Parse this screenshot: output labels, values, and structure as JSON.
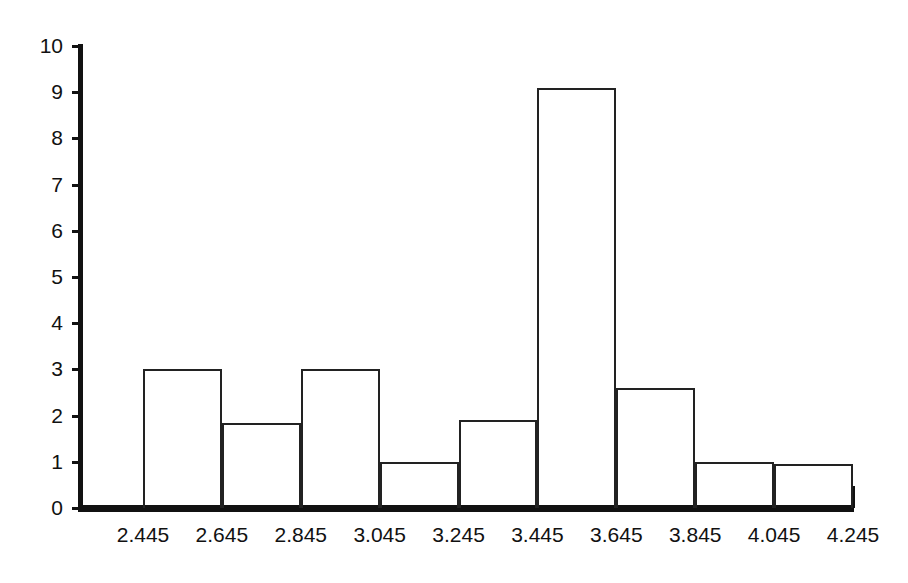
{
  "chart_data": {
    "type": "bar",
    "title": "",
    "subtitle": "",
    "xlabel": "",
    "ylabel": "",
    "grid": false,
    "legend": null,
    "style": "histogram-outline",
    "bin_edges": [
      2.445,
      2.645,
      2.845,
      3.045,
      3.245,
      3.445,
      3.645,
      3.845,
      4.045,
      4.245
    ],
    "bin_width": 0.2,
    "categories": [
      "2.445-2.645",
      "2.645-2.845",
      "2.845-3.045",
      "3.045-3.245",
      "3.245-3.445",
      "3.445-3.645",
      "3.645-3.845",
      "3.845-4.045",
      "4.045-4.245"
    ],
    "values": [
      3.0,
      1.85,
      3.0,
      1.0,
      1.9,
      9.1,
      2.6,
      1.0,
      0.95
    ],
    "xlim": [
      2.445,
      4.245
    ],
    "ylim": [
      0,
      10
    ],
    "x_tick_labels": [
      "2.445",
      "2.645",
      "2.845",
      "3.045",
      "3.245",
      "3.445",
      "3.645",
      "3.845",
      "4.045",
      "4.245"
    ],
    "y_tick_labels": [
      "0",
      "1",
      "2",
      "3",
      "4",
      "5",
      "6",
      "7",
      "8",
      "9",
      "10"
    ],
    "y_ticks": [
      0,
      1,
      2,
      3,
      4,
      5,
      6,
      7,
      8,
      9,
      10
    ],
    "colors": {
      "axis": "#111111",
      "bar_outline": "#222222",
      "bar_fill": "transparent",
      "background": "#ffffff",
      "text": "#111111"
    }
  }
}
